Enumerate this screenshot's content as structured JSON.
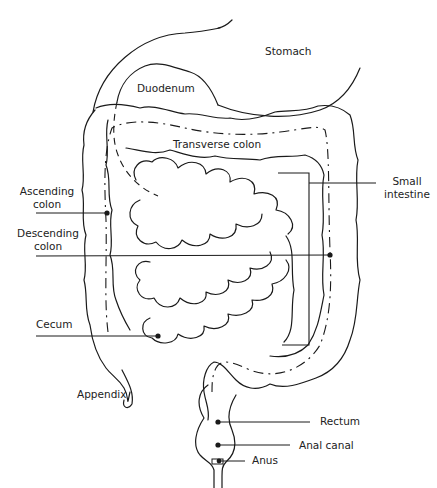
{
  "diagram": {
    "labels": {
      "stomach": "Stomach",
      "duodenum": "Duodenum",
      "transverse_colon": "Transverse colon",
      "small_intestine_1": "Small",
      "small_intestine_2": "intestine",
      "ascending_colon_1": "Ascending",
      "ascending_colon_2": "colon",
      "descending_colon_1": "Descending",
      "descending_colon_2": "colon",
      "cecum": "Cecum",
      "appendix": "Appendix",
      "rectum": "Rectum",
      "anal_canal": "Anal canal",
      "anus": "Anus"
    },
    "colors": {
      "line": "#1a1a1a",
      "background": "#ffffff",
      "text": "#222222"
    }
  }
}
